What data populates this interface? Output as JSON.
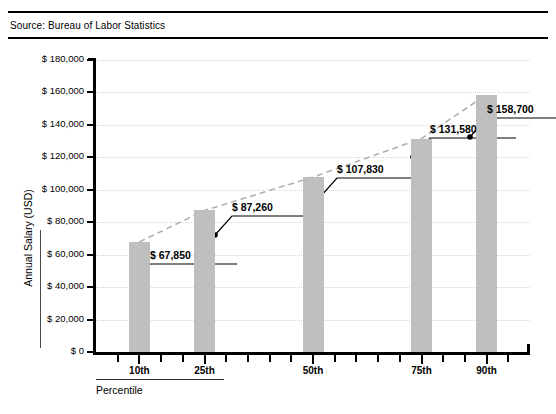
{
  "source": {
    "text": "Source: Bureau of Labor Statistics"
  },
  "chart_data": {
    "type": "bar",
    "title": "",
    "subtitle": "",
    "xlabel": "Percentile",
    "ylabel": "Annual Salary (USD)",
    "categories": [
      "10th",
      "25th",
      "50th",
      "75th",
      "90th"
    ],
    "values": [
      67850,
      87260,
      107830,
      131580,
      158700
    ],
    "value_labels": [
      "$ 67,850",
      "$ 87,260",
      "$ 107,830",
      "$ 131,580",
      "$ 158,700"
    ],
    "ylim": [
      0,
      180000
    ],
    "ytick_labels": [
      "$ 0",
      "$ 20,000",
      "$ 40,000",
      "$ 60,000",
      "$ 80,000",
      "$ 100,000",
      "$ 120,000",
      "$ 140,000",
      "$ 160,000",
      "$ 180,000"
    ],
    "ytick_values": [
      0,
      20000,
      40000,
      60000,
      80000,
      100000,
      120000,
      140000,
      160000,
      180000
    ],
    "grid": true,
    "grid_axis": "y",
    "legend": "none",
    "series": [
      {
        "name": "Annual Salary",
        "type": "bar",
        "values": [
          67850,
          87260,
          107830,
          131580,
          158700
        ],
        "color": "#bfbfbf"
      },
      {
        "name": "Trend",
        "type": "line",
        "style": "dashed",
        "color": "#b0b0b0",
        "values": [
          67850,
          87260,
          107830,
          131580,
          158700
        ]
      }
    ],
    "colors": {
      "bar": "#bfbfbf",
      "trend_line": "#b0b0b0",
      "axis": "#000000",
      "gridline": "#d6d6d6",
      "callout": "#000000"
    }
  }
}
